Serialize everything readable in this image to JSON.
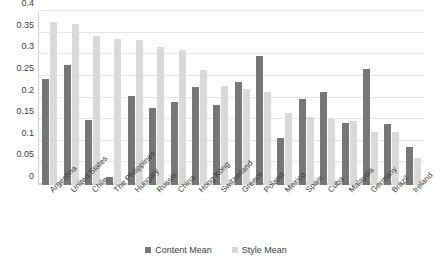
{
  "chart_data": {
    "type": "bar",
    "title": "",
    "subtitle": "",
    "xlabel": "",
    "ylabel": "",
    "ylim": [
      0,
      0.4
    ],
    "yticks": [
      0,
      0.05,
      0.1,
      0.15,
      0.2,
      0.25,
      0.3,
      0.35,
      0.4
    ],
    "ytick_labels": [
      "0",
      "0.05",
      "0.1",
      "0.15",
      "0.2",
      "0.25",
      "0.3",
      "0.35",
      "0.4"
    ],
    "grid": true,
    "legend_position": "bottom",
    "categories": [
      "Argentina",
      "United States",
      "Chile",
      "The Philippines",
      "Hungary",
      "Russia",
      "China",
      "Hong Kong",
      "Switzerland",
      "Greece",
      "Poland",
      "Mexico",
      "Spain",
      "Cuba",
      "Malaysia",
      "Germany",
      "Brazil",
      "Ireland"
    ],
    "series": [
      {
        "name": "Content Mean",
        "color": "#767676",
        "values": [
          0.245,
          0.277,
          0.15,
          0.018,
          0.206,
          0.179,
          0.192,
          0.227,
          0.184,
          0.238,
          0.298,
          0.109,
          0.199,
          0.214,
          0.144,
          0.268,
          0.14,
          0.088
        ]
      },
      {
        "name": "Style Mean",
        "color": "#d9d9d9",
        "values": [
          0.376,
          0.373,
          0.345,
          0.338,
          0.336,
          0.318,
          0.313,
          0.267,
          0.23,
          0.222,
          0.216,
          0.167,
          0.157,
          0.152,
          0.148,
          0.123,
          0.122,
          0.062
        ]
      }
    ]
  },
  "legend": {
    "items": [
      {
        "label": "Content Mean",
        "color": "#767676"
      },
      {
        "label": "Style Mean",
        "color": "#d9d9d9"
      }
    ]
  },
  "colors": {
    "content": "#767676",
    "style": "#d9d9d9",
    "gridline": "#e6e6e6",
    "axis": "#d2d2d2",
    "text": "#3b3b3b",
    "background": "#ffffff"
  }
}
